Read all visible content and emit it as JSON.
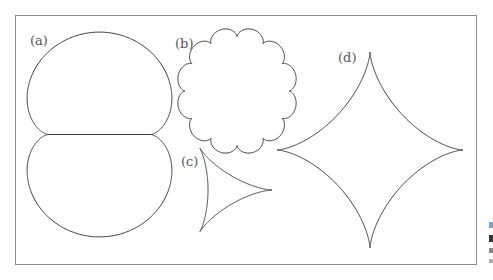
{
  "figure": {
    "frame": {
      "x": 15.5,
      "y": 15.5,
      "width": 461,
      "height": 249,
      "stroke": "#8c8c8c"
    },
    "curve_color": "#3a3a3a",
    "label_color": "#555555",
    "panels": [
      {
        "id": "a",
        "label": "(a)",
        "curve": "nephroid",
        "label_pos": [
          30,
          45
        ],
        "params": {
          "cx": 99.5,
          "cy": 134.5,
          "scale": 25.6
        }
      },
      {
        "id": "b",
        "label": "(b)",
        "curve": "epicycloid-12-lobes",
        "label_pos": [
          175,
          48
        ],
        "params": {
          "cx": 237,
          "cy": 91,
          "R": 52,
          "lobes": 12,
          "rx": 1.0,
          "ry": 1.05
        }
      },
      {
        "id": "c",
        "label": "(c)",
        "curve": "deltoid",
        "label_pos": [
          181,
          166
        ],
        "params": {
          "cx": 224,
          "cy": 190,
          "scale": 16
        }
      },
      {
        "id": "d",
        "label": "(d)",
        "curve": "astroid",
        "label_pos": [
          338,
          62
        ],
        "params": {
          "cx": 370,
          "cy": 150,
          "ax": 93,
          "ay": 98
        }
      }
    ],
    "edge_fragments": [
      {
        "y": 222,
        "h": 6,
        "color": "#7aa0d8"
      },
      {
        "y": 235,
        "h": 7,
        "color": "#333333"
      },
      {
        "y": 248,
        "h": 5,
        "color": "#888888"
      },
      {
        "y": 259,
        "h": 4,
        "color": "#aaaaaa"
      }
    ]
  }
}
